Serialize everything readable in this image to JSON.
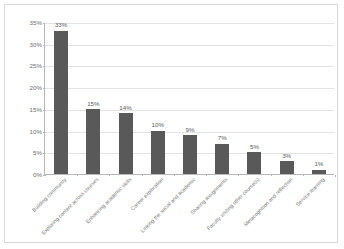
{
  "chart_data": {
    "type": "bar",
    "title": "",
    "xlabel": "",
    "ylabel": "",
    "ylim": [
      0,
      35
    ],
    "ytick_labels": [
      "0%",
      "5%",
      "10%",
      "15%",
      "20%",
      "25%",
      "30%",
      "35%"
    ],
    "ytick_values": [
      0,
      5,
      10,
      15,
      20,
      25,
      30,
      35
    ],
    "grid": true,
    "legend": "none",
    "bar_color": "#595959",
    "categories": [
      "Building community",
      "Exploring content across courses",
      "Enhancing academic skills",
      "Career exploration",
      "Linking the social and academic",
      "Sharing assignments",
      "Faculty visiting other course(s)",
      "Metacognition and reflection",
      "Service learning"
    ],
    "values": [
      33,
      15,
      14,
      10,
      9,
      7,
      5,
      3,
      1
    ],
    "data_labels": [
      "33%",
      "15%",
      "14%",
      "10%",
      "9%",
      "7%",
      "5%",
      "3%",
      "1%"
    ]
  }
}
